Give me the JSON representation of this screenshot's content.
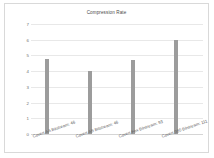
{
  "chart_data": {
    "type": "bar",
    "title": "Compression Rate",
    "xlabel": "",
    "ylabel": "",
    "categories": [
      "Covert AA Bitstream: 46",
      "Covert AB Bitstream: 46",
      "Covert Fox Bitstream: 93",
      "Covert 980 Bitstream: 111"
    ],
    "values": [
      4.8,
      4.0,
      4.7,
      6.0
    ],
    "ylim": [
      0,
      7
    ],
    "yticks": [
      0,
      1,
      2,
      3,
      4,
      5,
      6,
      7
    ],
    "ytick_labels": [
      "0",
      "1",
      "2",
      "3",
      "4",
      "5",
      "6",
      "7"
    ],
    "grid": true,
    "legend": false,
    "series": [
      {
        "name": "Compression Rate",
        "color": "#9c9c9c",
        "values": [
          4.8,
          4.0,
          4.7,
          6.0
        ]
      }
    ]
  },
  "colors": {
    "bar": "#9c9c9c",
    "grid": "#e8e8e8",
    "frame": "#d9d9d9",
    "title_text": "#4a4a4a",
    "tick_text": "#707070",
    "label_text": "#5d5d5d",
    "background": "#ffffff"
  }
}
